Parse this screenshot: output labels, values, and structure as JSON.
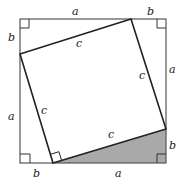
{
  "diagram": {
    "colors": {
      "stroke": "#222222",
      "outer_stroke": "#555555",
      "shade": "#a9a9a9",
      "background": "#ffffff"
    },
    "outer_square": {
      "x": 20,
      "y": 19,
      "size": 146
    },
    "inner_square_vertices": [
      [
        131,
        19
      ],
      [
        166,
        129
      ],
      [
        53,
        163
      ],
      [
        20,
        54
      ]
    ],
    "shaded_triangle": [
      [
        53,
        163
      ],
      [
        166,
        163
      ],
      [
        166,
        129
      ]
    ],
    "labels": {
      "top_a": "a",
      "top_b": "b",
      "left_b": "b",
      "left_a": "a",
      "right_a": "a",
      "right_b": "b",
      "bottom_b": "b",
      "bottom_a": "a",
      "c_top": "c",
      "c_left": "c",
      "c_right": "c",
      "c_bottom": "c"
    },
    "right_angle_markers": [
      "top-left",
      "top-right",
      "bottom-left",
      "bottom-right",
      "inner-bottom"
    ]
  }
}
